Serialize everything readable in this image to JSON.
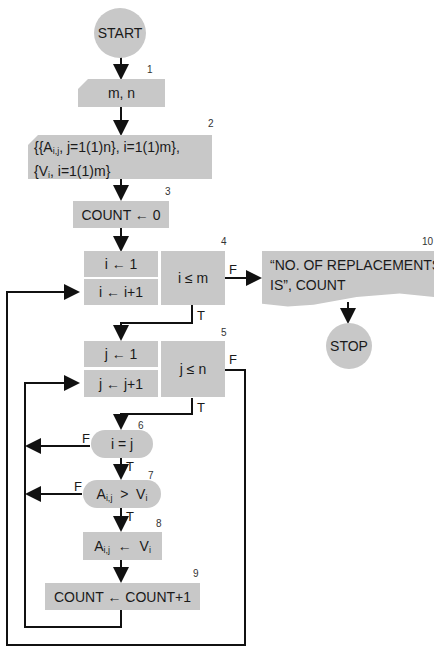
{
  "flowchart": {
    "start": "START",
    "stop": "STOP",
    "nodes": {
      "n1": {
        "number": "1",
        "text": "m,  n"
      },
      "n2": {
        "number": "2",
        "line1_prefix": "{{A",
        "line1_sub": "i,j",
        "line1_rest": ",  j=1(1)n},  i=1(1)m},",
        "line2_prefix": "{V",
        "line2_sub": "i",
        "line2_rest": ",  i=1(1)m}"
      },
      "n3": {
        "number": "3",
        "text": "COUNT  ←  0"
      },
      "n4": {
        "number": "4",
        "init": "i  ←  1",
        "incr": "i  ←  i+1",
        "test": "i  ≤  m"
      },
      "n5": {
        "number": "5",
        "init": "j  ←  1",
        "incr": "j  ←  j+1",
        "test": "j  ≤  n"
      },
      "n6": {
        "number": "6",
        "text": "i  =  j"
      },
      "n7": {
        "number": "7",
        "lhs": "A",
        "lhs_sub": "i,j",
        "op": "  >  ",
        "rhs": "V",
        "rhs_sub": "i"
      },
      "n8": {
        "number": "8",
        "lhs": "A",
        "lhs_sub": "i,j",
        "op": "  ←  ",
        "rhs": "V",
        "rhs_sub": "i"
      },
      "n9": {
        "number": "9",
        "text": "COUNT  ←  COUNT+1"
      },
      "n10": {
        "number": "10",
        "line1": "“NO. OF REPLACEMENTS",
        "line2": "IS”, COUNT"
      }
    },
    "labels": {
      "true": "T",
      "false": "F"
    },
    "colors": {
      "shape_fill": "#c8c8c8",
      "line": "#111111"
    }
  }
}
